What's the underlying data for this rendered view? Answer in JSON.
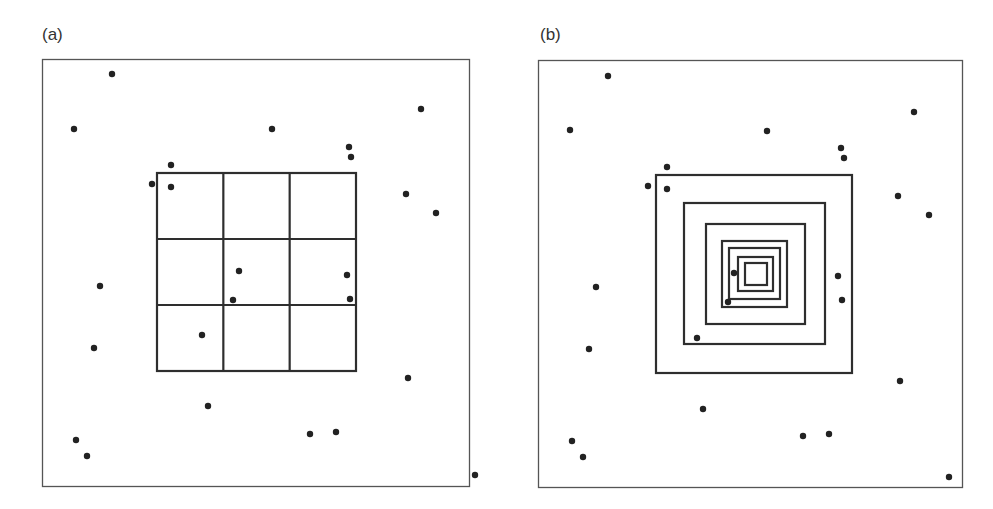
{
  "panels": [
    {
      "id": "a",
      "label": "(a)",
      "description": "Uniform 3x3 grid subdivision of the central region",
      "frame": {
        "width": 428,
        "height": 428
      },
      "grid": {
        "x": 115,
        "y": 114,
        "width": 199,
        "height": 198,
        "rows": 3,
        "cols": 3
      },
      "points": [
        [
          70,
          15
        ],
        [
          32,
          70
        ],
        [
          230,
          70
        ],
        [
          129,
          106
        ],
        [
          110,
          125
        ],
        [
          129,
          128
        ],
        [
          307,
          88
        ],
        [
          309,
          98
        ],
        [
          379,
          50
        ],
        [
          364,
          135
        ],
        [
          394,
          154
        ],
        [
          58,
          227
        ],
        [
          52,
          289
        ],
        [
          197,
          212
        ],
        [
          191,
          241
        ],
        [
          160,
          276
        ],
        [
          305,
          216
        ],
        [
          308,
          240
        ],
        [
          366,
          319
        ],
        [
          166,
          347
        ],
        [
          34,
          381
        ],
        [
          45,
          397
        ],
        [
          268,
          375
        ],
        [
          294,
          373
        ],
        [
          433,
          416
        ]
      ]
    },
    {
      "id": "b",
      "label": "(b)",
      "description": "Nested concentric squares converging toward the center",
      "frame": {
        "width": 425,
        "height": 428
      },
      "nested_squares": [
        {
          "x": 118,
          "y": 115,
          "width": 196,
          "height": 198
        },
        {
          "x": 146,
          "y": 143,
          "width": 141,
          "height": 141
        },
        {
          "x": 168,
          "y": 164,
          "width": 99,
          "height": 100
        },
        {
          "x": 184,
          "y": 181,
          "width": 65,
          "height": 66
        },
        {
          "x": 191,
          "y": 188,
          "width": 51,
          "height": 51
        },
        {
          "x": 200,
          "y": 197,
          "width": 35,
          "height": 34
        },
        {
          "x": 207,
          "y": 203,
          "width": 22,
          "height": 22
        }
      ],
      "points": [
        [
          70,
          16
        ],
        [
          32,
          70
        ],
        [
          229,
          71
        ],
        [
          129,
          107
        ],
        [
          110,
          126
        ],
        [
          129,
          129
        ],
        [
          303,
          88
        ],
        [
          306,
          98
        ],
        [
          376,
          52
        ],
        [
          360,
          136
        ],
        [
          391,
          155
        ],
        [
          58,
          227
        ],
        [
          51,
          289
        ],
        [
          196,
          213
        ],
        [
          190,
          242
        ],
        [
          159,
          278
        ],
        [
          300,
          216
        ],
        [
          304,
          240
        ],
        [
          362,
          321
        ],
        [
          165,
          349
        ],
        [
          34,
          381
        ],
        [
          45,
          397
        ],
        [
          265,
          376
        ],
        [
          291,
          374
        ],
        [
          411,
          417
        ]
      ]
    }
  ],
  "style": {
    "line_color": "#2e2e2e",
    "frame_color": "#555555",
    "dot_color": "#222222",
    "dot_radius": 3.2
  }
}
